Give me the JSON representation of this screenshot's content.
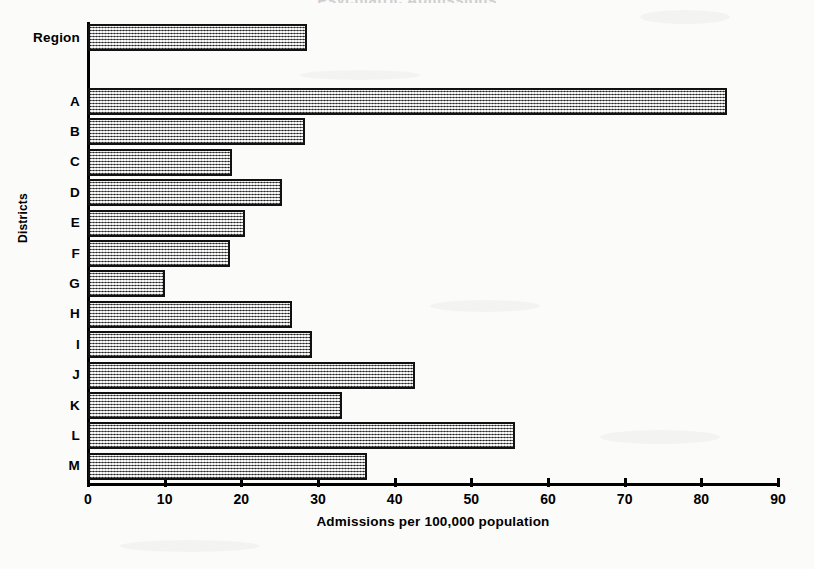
{
  "chart_data": {
    "type": "bar",
    "orientation": "horizontal",
    "title": "Psychiatric Admissions",
    "xlabel": "Admissions per 100,000 population",
    "ylabel": "Districts",
    "xlim": [
      0,
      90
    ],
    "xticks": [
      0,
      10,
      20,
      30,
      40,
      50,
      60,
      70,
      80,
      90
    ],
    "grid": false,
    "legend": "none",
    "categories": [
      "Region",
      "A",
      "B",
      "C",
      "D",
      "E",
      "F",
      "G",
      "H",
      "I",
      "J",
      "K",
      "L",
      "M"
    ],
    "values": [
      28.5,
      83.4,
      28.3,
      18.8,
      25.3,
      20.5,
      18.5,
      10.0,
      26.6,
      29.2,
      42.6,
      33.1,
      55.7,
      36.4
    ],
    "bars": [
      {
        "label": "Region",
        "value": 28.5,
        "group": "region"
      },
      {
        "label": "A",
        "value": 83.4,
        "group": "district"
      },
      {
        "label": "B",
        "value": 28.3,
        "group": "district"
      },
      {
        "label": "C",
        "value": 18.8,
        "group": "district"
      },
      {
        "label": "D",
        "value": 25.3,
        "group": "district"
      },
      {
        "label": "E",
        "value": 20.5,
        "group": "district"
      },
      {
        "label": "F",
        "value": 18.5,
        "group": "district"
      },
      {
        "label": "G",
        "value": 10.0,
        "group": "district"
      },
      {
        "label": "H",
        "value": 26.6,
        "group": "district"
      },
      {
        "label": "I",
        "value": 29.2,
        "group": "district"
      },
      {
        "label": "J",
        "value": 42.6,
        "group": "district"
      },
      {
        "label": "K",
        "value": 33.1,
        "group": "district"
      },
      {
        "label": "L",
        "value": 55.7,
        "group": "district"
      },
      {
        "label": "M",
        "value": 36.4,
        "group": "district"
      }
    ],
    "colors": {
      "bar_fill": "#a9a9a9",
      "bar_border": "#111111",
      "axis": "#000000",
      "background": "#fbfbf9"
    }
  }
}
